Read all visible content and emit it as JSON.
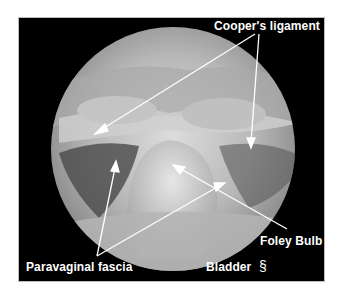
{
  "figure": {
    "labels": {
      "coopers_ligament": "Cooper's ligament",
      "foley_bulb": "Foley Bulb",
      "paravaginal_fascia": "Paravaginal fascia",
      "bladder": "Bladder"
    },
    "logo_glyph": "§"
  }
}
